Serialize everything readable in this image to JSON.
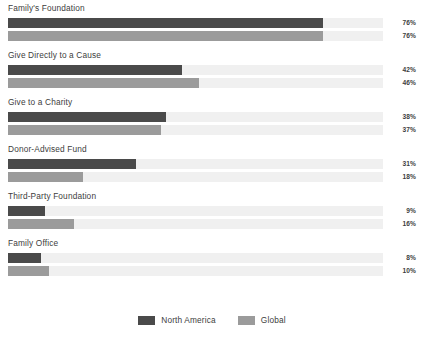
{
  "chart_data": {
    "type": "bar",
    "title": "",
    "xlabel": "",
    "ylabel": "",
    "orientation": "horizontal",
    "grid": false,
    "legend_position": "bottom-center",
    "xlim": [
      0,
      100
    ],
    "value_suffix": "%",
    "px_per_percent": 4.145,
    "categories": [
      "Family's Foundation",
      "Give Directly to a Cause",
      "Give to a Charity",
      "Donor-Advised Fund",
      "Third-Party Foundation",
      "Family Office"
    ],
    "series": [
      {
        "name": "North America",
        "color": "#4a4a4a",
        "values": [
          76,
          42,
          38,
          31,
          9,
          8
        ]
      },
      {
        "name": "Global",
        "color": "#9b9b9b",
        "values": [
          76,
          46,
          37,
          18,
          16,
          10
        ]
      }
    ]
  },
  "groups": [
    {
      "label": "Family's Foundation",
      "na": {
        "value": 76,
        "value_label": "76%"
      },
      "gl": {
        "value": 76,
        "value_label": "76%"
      }
    },
    {
      "label": "Give Directly to a Cause",
      "na": {
        "value": 42,
        "value_label": "42%"
      },
      "gl": {
        "value": 46,
        "value_label": "46%"
      }
    },
    {
      "label": "Give to a Charity",
      "na": {
        "value": 38,
        "value_label": "38%"
      },
      "gl": {
        "value": 37,
        "value_label": "37%"
      }
    },
    {
      "label": "Donor-Advised Fund",
      "na": {
        "value": 31,
        "value_label": "31%"
      },
      "gl": {
        "value": 18,
        "value_label": "18%"
      }
    },
    {
      "label": "Third-Party Foundation",
      "na": {
        "value": 9,
        "value_label": "9%"
      },
      "gl": {
        "value": 16,
        "value_label": "16%"
      }
    },
    {
      "label": "Family Office",
      "na": {
        "value": 8,
        "value_label": "8%"
      },
      "gl": {
        "value": 10,
        "value_label": "10%"
      }
    }
  ],
  "legend": {
    "items": [
      {
        "label": "North America",
        "color": "#4a4a4a"
      },
      {
        "label": "Global",
        "color": "#9b9b9b"
      }
    ]
  }
}
